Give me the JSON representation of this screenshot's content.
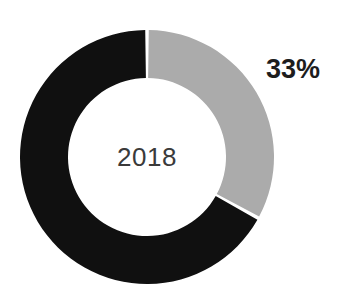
{
  "chart_data": {
    "type": "pie",
    "variant": "donut",
    "title": "",
    "subtitle": "",
    "xlabel": "",
    "ylabel": "",
    "center_label": "2018",
    "legend": [],
    "legend_position": "none",
    "grid": false,
    "start_angle_deg": 0,
    "direction": "clockwise",
    "background_color": "#ffffff",
    "geometry": {
      "center_x": 147,
      "center_y": 157,
      "outer_radius": 127,
      "inner_radius": 79,
      "segment_gap_deg": 1.6
    },
    "categories": [
      "Share",
      "Remainder"
    ],
    "values": [
      33,
      67
    ],
    "units": "%",
    "slices": [
      {
        "name": "Share",
        "value": 33,
        "label": "33%",
        "color": "#ababab",
        "start_deg": 0,
        "end_deg": 118.8,
        "label_shown": true
      },
      {
        "name": "Remainder",
        "value": 67,
        "label": "",
        "color": "#101010",
        "start_deg": 118.8,
        "end_deg": 360,
        "label_shown": false
      }
    ],
    "annotations": [
      {
        "name": "percent-callout",
        "text": "33%",
        "x": 296,
        "y": 69
      },
      {
        "name": "center-year",
        "text": "2018",
        "x": 147,
        "y": 157
      }
    ]
  },
  "labels": {
    "percent": "33%",
    "center_year": "2018"
  },
  "colors": {
    "slice_highlight": "#ababab",
    "slice_base": "#101010",
    "label_dark": "#1d1d1d",
    "label_center": "#3a3a3a",
    "background": "#ffffff"
  }
}
